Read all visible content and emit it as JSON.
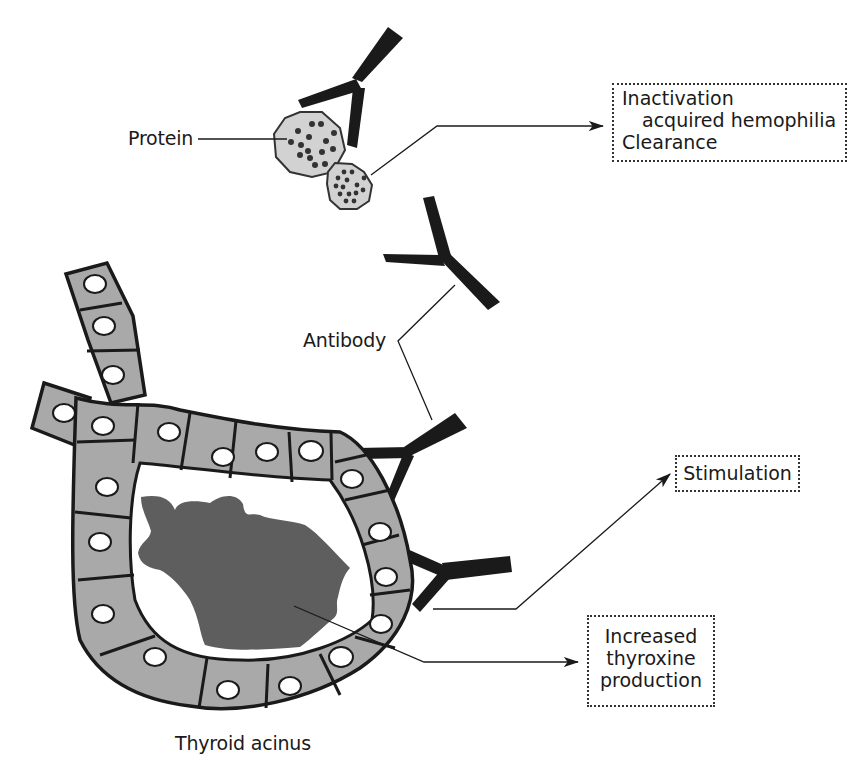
{
  "diagram": {
    "type": "biological-illustration",
    "labels": {
      "protein": "Protein",
      "antibody": "Antibody",
      "thyroid_acinus": "Thyroid acinus"
    },
    "outcome_boxes": {
      "inactivation": {
        "lines": [
          "Inactivation",
          "acquired hemophilia",
          "Clearance"
        ]
      },
      "stimulation": {
        "lines": [
          "Stimulation"
        ]
      },
      "thyroxine": {
        "lines": [
          "Increased",
          "thyroxine",
          "production"
        ]
      }
    },
    "colors": {
      "antibody": "#1a1a1a",
      "cell_fill": "#a9a9a9",
      "colloid": "#5e5e5e",
      "protein_fill": "#d2d2d2",
      "nucleus": "#ffffff",
      "line": "#1a1a1a"
    }
  }
}
